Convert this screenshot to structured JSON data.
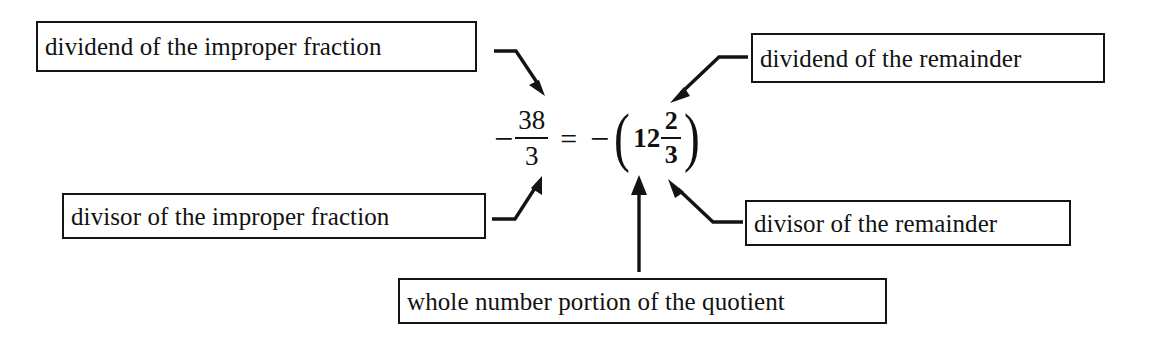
{
  "diagram": {
    "background_color": "#ffffff",
    "ink_color": "#131313"
  },
  "equation": {
    "left_side": {
      "sign": "−",
      "numerator": "38",
      "denominator": "3",
      "plain": "-38/3"
    },
    "equals": "=",
    "right_side": {
      "sign": "−",
      "open_paren": "(",
      "whole": "12",
      "numerator": "2",
      "denominator": "3",
      "close_paren": ")",
      "plain": "-(12 2/3)"
    },
    "plain_text": "-38/3 = -(12 2/3)"
  },
  "labels": {
    "dividend_improper": "dividend of the improper fraction",
    "dividend_remainder": "dividend of the remainder",
    "divisor_improper": "divisor of the improper fraction",
    "divisor_remainder": "divisor of the remainder",
    "whole_number": "whole number portion of the quotient"
  },
  "connectors": [
    {
      "name": "dividend-improper-arrow",
      "from": "dividend of the improper fraction",
      "to": "38",
      "direction": "down-right"
    },
    {
      "name": "dividend-remainder-arrow",
      "from": "dividend of the remainder",
      "to": "2",
      "direction": "down-left"
    },
    {
      "name": "divisor-improper-arrow",
      "from": "divisor of the improper fraction",
      "to": "3",
      "direction": "up-right"
    },
    {
      "name": "divisor-remainder-arrow",
      "from": "divisor of the remainder",
      "to": "3",
      "direction": "up-left"
    },
    {
      "name": "whole-number-arrow",
      "from": "whole number portion of the quotient",
      "to": "12",
      "direction": "up"
    }
  ]
}
